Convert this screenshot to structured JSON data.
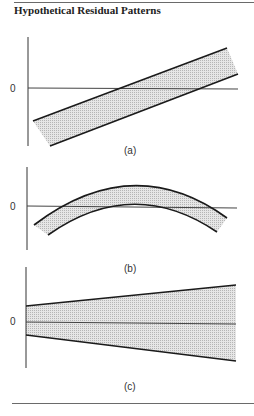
{
  "figure": {
    "title": "Hypothetical Residual Patterns",
    "zero_label": "0",
    "panels": [
      {
        "id": "a",
        "caption": "(a)",
        "pattern": "linear trend band"
      },
      {
        "id": "b",
        "caption": "(b)",
        "pattern": "curved (quadratic) band"
      },
      {
        "id": "c",
        "caption": "(c)",
        "pattern": "widening (funnel) band"
      }
    ]
  },
  "colors": {
    "band_fill": "#d8d8d8",
    "line": "#1a1a1a",
    "axis": "#333333",
    "rule": "#6a6a6a"
  }
}
